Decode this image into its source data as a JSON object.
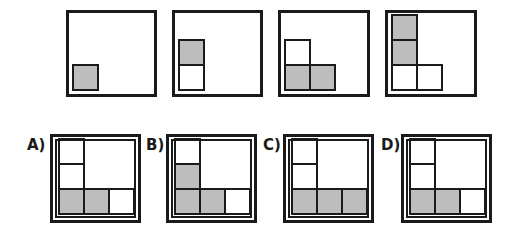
{
  "colors": {
    "filled": "#bdbdbd",
    "empty": "#ffffff",
    "border": "#1a1a1a"
  },
  "sequence": [
    {
      "id": "seq-1",
      "cells": [
        {
          "col": 0,
          "row": 0,
          "fill": "gray"
        }
      ]
    },
    {
      "id": "seq-2",
      "cells": [
        {
          "col": 0,
          "row": 1,
          "fill": "gray"
        },
        {
          "col": 0,
          "row": 0,
          "fill": "white"
        }
      ]
    },
    {
      "id": "seq-3",
      "cells": [
        {
          "col": 0,
          "row": 1,
          "fill": "white"
        },
        {
          "col": 0,
          "row": 0,
          "fill": "gray"
        },
        {
          "col": 1,
          "row": 0,
          "fill": "gray"
        }
      ]
    },
    {
      "id": "seq-4",
      "cells": [
        {
          "col": 0,
          "row": 2,
          "fill": "gray"
        },
        {
          "col": 0,
          "row": 1,
          "fill": "gray"
        },
        {
          "col": 0,
          "row": 0,
          "fill": "white"
        },
        {
          "col": 1,
          "row": 0,
          "fill": "white"
        }
      ]
    }
  ],
  "options": [
    {
      "label": "A)",
      "cells": [
        {
          "col": 0,
          "row": 2,
          "fill": "white"
        },
        {
          "col": 0,
          "row": 1,
          "fill": "white"
        },
        {
          "col": 0,
          "row": 0,
          "fill": "gray"
        },
        {
          "col": 1,
          "row": 0,
          "fill": "gray"
        },
        {
          "col": 2,
          "row": 0,
          "fill": "white"
        }
      ]
    },
    {
      "label": "B)",
      "cells": [
        {
          "col": 0,
          "row": 2,
          "fill": "white"
        },
        {
          "col": 0,
          "row": 1,
          "fill": "gray"
        },
        {
          "col": 0,
          "row": 0,
          "fill": "gray"
        },
        {
          "col": 1,
          "row": 0,
          "fill": "gray"
        },
        {
          "col": 2,
          "row": 0,
          "fill": "white"
        }
      ]
    },
    {
      "label": "C)",
      "cells": [
        {
          "col": 0,
          "row": 2,
          "fill": "white"
        },
        {
          "col": 0,
          "row": 1,
          "fill": "white"
        },
        {
          "col": 0,
          "row": 0,
          "fill": "gray"
        },
        {
          "col": 1,
          "row": 0,
          "fill": "gray"
        },
        {
          "col": 2,
          "row": 0,
          "fill": "gray"
        }
      ]
    },
    {
      "label": "D)",
      "cells": [
        {
          "col": 0,
          "row": 2,
          "fill": "white"
        },
        {
          "col": 0,
          "row": 1,
          "fill": "white"
        },
        {
          "col": 0,
          "row": 0,
          "fill": "gray"
        },
        {
          "col": 1,
          "row": 0,
          "fill": "gray"
        },
        {
          "col": 2,
          "row": 0,
          "fill": "white"
        }
      ]
    }
  ]
}
